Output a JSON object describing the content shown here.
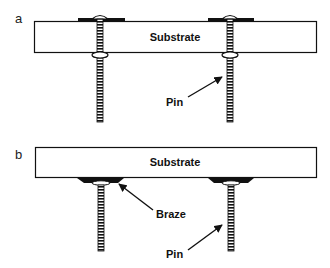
{
  "figure": {
    "panels": [
      {
        "id": "a",
        "label": "a",
        "substrate_label": "Substrate",
        "callouts": [
          {
            "text": "Pin"
          }
        ]
      },
      {
        "id": "b",
        "label": "b",
        "substrate_label": "Substrate",
        "callouts": [
          {
            "text": "Braze"
          },
          {
            "text": "Pin"
          }
        ]
      }
    ],
    "colors": {
      "line": "#111111",
      "fill": "#ffffff"
    }
  }
}
